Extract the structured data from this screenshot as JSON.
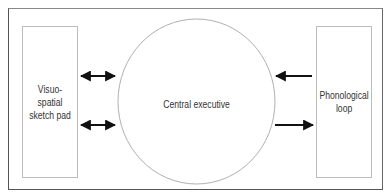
{
  "diagram": {
    "nodes": [
      {
        "id": "visuo",
        "label": "Visuo-spatial\nsketch pad",
        "shape": "rectangle"
      },
      {
        "id": "central",
        "label": "Central executive",
        "shape": "circle"
      },
      {
        "id": "phono",
        "label": "Phonological\nloop",
        "shape": "rectangle"
      }
    ],
    "edges": [
      {
        "from": "visuo",
        "to": "central",
        "direction": "both",
        "position": "upper"
      },
      {
        "from": "visuo",
        "to": "central",
        "direction": "both",
        "position": "lower"
      },
      {
        "from": "phono",
        "to": "central",
        "direction": "forward",
        "position": "upper"
      },
      {
        "from": "central",
        "to": "phono",
        "direction": "forward",
        "position": "lower"
      }
    ],
    "colors": {
      "stroke": "#bcbcbc",
      "arrow": "#111111",
      "frame": "#555555",
      "text": "#333333"
    }
  }
}
